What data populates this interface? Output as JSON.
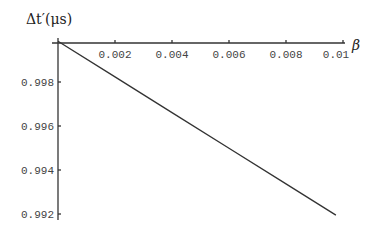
{
  "chart_data": {
    "type": "line",
    "title": "",
    "xlabel": "β",
    "ylabel": "Δt′(μs)",
    "xlim": [
      0,
      0.0102
    ],
    "ylim": [
      0.9918,
      0.9998
    ],
    "x_ticks": [
      "0.002",
      "0.004",
      "0.006",
      "0.008",
      "0.01"
    ],
    "y_ticks": [
      "0.998",
      "0.996",
      "0.994",
      "0.992"
    ],
    "grid": false,
    "legend": null,
    "series": [
      {
        "name": "Δt′",
        "x": [
          0,
          0.002,
          0.004,
          0.006,
          0.008,
          0.00975
        ],
        "values": [
          0.99985,
          0.99823,
          0.99661,
          0.99499,
          0.99337,
          0.99195
        ]
      }
    ]
  },
  "labels": {
    "y_axis_title": "Δt′(μs)",
    "x_axis_title": "β"
  }
}
